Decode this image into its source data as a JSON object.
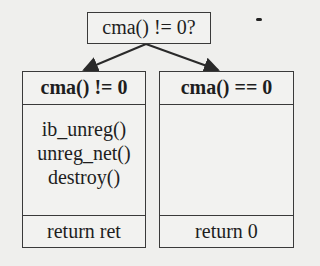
{
  "diagram": {
    "decision": {
      "label": "cma() != 0?"
    },
    "branches": [
      {
        "header": "cma() != 0",
        "body": [
          "ib_unreg()",
          "unreg_net()",
          "destroy()"
        ],
        "footer": "return ret"
      },
      {
        "header": "cma() == 0",
        "body": [],
        "footer": "return 0"
      }
    ]
  }
}
